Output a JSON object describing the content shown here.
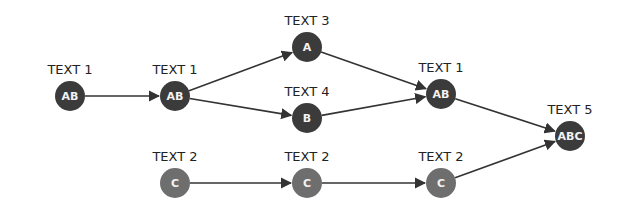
{
  "diagram": {
    "colors": {
      "dark_node": "#3b3b3b",
      "light_node": "#6e6e6e",
      "edge": "#333333",
      "label": "#222222",
      "node_text": "#f2f2f2"
    },
    "nodes": [
      {
        "id": "n1",
        "label": "TEXT 1",
        "text": "AB",
        "x": 70,
        "y": 96,
        "style": "dark"
      },
      {
        "id": "n2",
        "label": "TEXT 1",
        "text": "AB",
        "x": 175,
        "y": 96,
        "style": "dark"
      },
      {
        "id": "n3",
        "label": "TEXT 3",
        "text": "A",
        "x": 307,
        "y": 47,
        "style": "dark"
      },
      {
        "id": "n4",
        "label": "TEXT 4",
        "text": "B",
        "x": 307,
        "y": 118,
        "style": "dark"
      },
      {
        "id": "n5",
        "label": "TEXT 2",
        "text": "C",
        "x": 175,
        "y": 183,
        "style": "light"
      },
      {
        "id": "n6",
        "label": "TEXT 2",
        "text": "C",
        "x": 307,
        "y": 183,
        "style": "light"
      },
      {
        "id": "n7",
        "label": "TEXT 1",
        "text": "AB",
        "x": 441,
        "y": 94,
        "style": "dark"
      },
      {
        "id": "n8",
        "label": "TEXT 2",
        "text": "C",
        "x": 441,
        "y": 183,
        "style": "light"
      },
      {
        "id": "n9",
        "label": "TEXT 5",
        "text": "ABC",
        "x": 570,
        "y": 136,
        "style": "dark"
      }
    ],
    "edges": [
      {
        "from": "n1",
        "to": "n2"
      },
      {
        "from": "n2",
        "to": "n3"
      },
      {
        "from": "n2",
        "to": "n4"
      },
      {
        "from": "n3",
        "to": "n7"
      },
      {
        "from": "n4",
        "to": "n7"
      },
      {
        "from": "n5",
        "to": "n6"
      },
      {
        "from": "n6",
        "to": "n8"
      },
      {
        "from": "n7",
        "to": "n9"
      },
      {
        "from": "n8",
        "to": "n9"
      }
    ]
  }
}
